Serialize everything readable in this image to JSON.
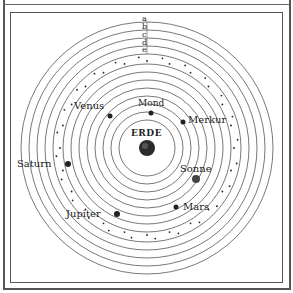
{
  "diagram": {
    "title": "",
    "center": {
      "label": "ERDE",
      "x": 147,
      "y": 148
    },
    "ring_letters": [
      "a",
      "b",
      "c",
      "d",
      "e"
    ],
    "ring_radii": [
      28,
      36,
      44,
      52,
      60,
      68,
      76,
      84,
      94,
      102,
      110,
      118,
      126
    ],
    "star_band_radii": [
      87,
      91
    ],
    "bodies": [
      {
        "name": "Mond",
        "x": 151,
        "y": 113,
        "r": 2.5
      },
      {
        "name": "Merkur",
        "x": 183,
        "y": 122,
        "r": 2.5
      },
      {
        "name": "Venus",
        "x": 110,
        "y": 116,
        "r": 2.5
      },
      {
        "name": "Sonne",
        "x": 196,
        "y": 179,
        "r": 4
      },
      {
        "name": "Mars",
        "x": 176,
        "y": 207,
        "r": 2.5
      },
      {
        "name": "Jupiter",
        "x": 117,
        "y": 214,
        "r": 3
      },
      {
        "name": "Saturn",
        "x": 68,
        "y": 164,
        "r": 3
      }
    ],
    "colors": {
      "line": "#555555",
      "ink": "#222222",
      "background": "#ffffff"
    }
  },
  "labels": {
    "erde": "ERDE",
    "mond": "Mond",
    "merkur": "Merkur",
    "venus": "Venus",
    "sonne": "Sonne",
    "mars": "Mars",
    "jupiter": "Jupiter",
    "saturn": "Saturn",
    "a": "a",
    "b": "b",
    "c": "c",
    "d": "d",
    "e": "e"
  }
}
